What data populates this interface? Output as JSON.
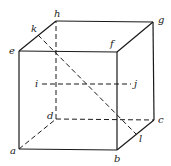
{
  "diagram": {
    "type": "cube",
    "vertices": {
      "a": {
        "label": "a",
        "x": 19,
        "y": 149,
        "lx": 10,
        "ly": 154
      },
      "b": {
        "label": "b",
        "x": 117,
        "y": 150,
        "lx": 114,
        "ly": 162
      },
      "c": {
        "label": "c",
        "x": 154,
        "y": 120,
        "lx": 158,
        "ly": 123
      },
      "d": {
        "label": "d",
        "x": 56,
        "y": 119,
        "lx": 47,
        "ly": 119
      },
      "e": {
        "label": "e",
        "x": 19,
        "y": 51,
        "lx": 9,
        "ly": 54
      },
      "f": {
        "label": "f",
        "x": 117,
        "y": 52,
        "lx": 110,
        "ly": 47
      },
      "g": {
        "label": "g",
        "x": 153,
        "y": 22,
        "lx": 158,
        "ly": 23
      },
      "h": {
        "label": "h",
        "x": 56,
        "y": 21,
        "lx": 54,
        "ly": 17
      }
    },
    "points": {
      "i": {
        "label": "i",
        "x": 42,
        "y": 84,
        "lx": 35,
        "ly": 87
      },
      "j": {
        "label": "j",
        "x": 131,
        "y": 84,
        "lx": 134,
        "ly": 87
      },
      "k": {
        "label": "k",
        "x": 38,
        "y": 35,
        "lx": 31,
        "ly": 32
      },
      "l": {
        "label": "l",
        "x": 136,
        "y": 134,
        "lx": 139,
        "ly": 142
      }
    },
    "solid_edges": [
      "a-b",
      "b-f",
      "f-e",
      "e-a",
      "e-h",
      "h-g",
      "g-f",
      "g-c",
      "c-b"
    ],
    "dashed_edges": [
      "a-d",
      "d-c",
      "d-h",
      "i-j",
      "k-l"
    ]
  }
}
